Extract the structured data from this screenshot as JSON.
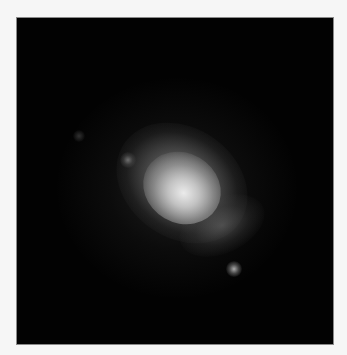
{
  "image": {
    "subject": "spiral galaxy",
    "background_color": "#020202",
    "border_color": "#8a8a8a",
    "page_color": "#f6f6f6",
    "features": [
      {
        "name": "galaxy-core",
        "x": 177,
        "y": 188
      },
      {
        "name": "field-star",
        "x": 233,
        "y": 268
      },
      {
        "name": "faint-blob",
        "x": 128,
        "y": 160
      },
      {
        "name": "faint-blob-2",
        "x": 78,
        "y": 135
      }
    ]
  }
}
